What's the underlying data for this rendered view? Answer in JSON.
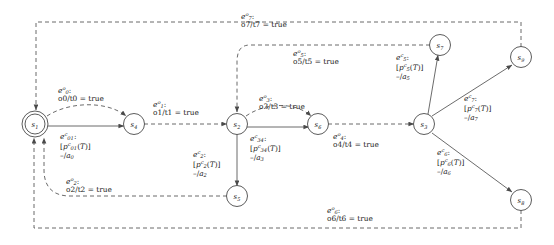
{
  "diagram": {
    "colors": {
      "stroke": "#5a5a5a",
      "text": "#1b1b1b",
      "background": "#ffffff"
    },
    "states": [
      {
        "id": "s1",
        "name": "s",
        "index": "1",
        "x": 35,
        "y": 124,
        "accepting": true
      },
      {
        "id": "s4",
        "name": "s",
        "index": "4",
        "x": 134,
        "y": 124,
        "accepting": false
      },
      {
        "id": "s2",
        "name": "s",
        "index": "2",
        "x": 237,
        "y": 124,
        "accepting": false
      },
      {
        "id": "s6",
        "name": "s",
        "index": "6",
        "x": 318,
        "y": 124,
        "accepting": false
      },
      {
        "id": "s3",
        "name": "s",
        "index": "3",
        "x": 424,
        "y": 124,
        "accepting": false
      },
      {
        "id": "s7",
        "name": "s",
        "index": "7",
        "x": 440,
        "y": 45,
        "accepting": false
      },
      {
        "id": "s9",
        "name": "s",
        "index": "9",
        "x": 521,
        "y": 57,
        "accepting": false
      },
      {
        "id": "s8",
        "name": "s",
        "index": "8",
        "x": 521,
        "y": 200,
        "accepting": false
      },
      {
        "id": "s5",
        "name": "s",
        "index": "5",
        "x": 237,
        "y": 196,
        "accepting": false
      }
    ],
    "edge_labels": [
      {
        "id": "e7o",
        "event": "e",
        "sup": "o",
        "sub": "7",
        "line2": "o7/t7 = true",
        "x": 245,
        "y": 14,
        "kind": "observable"
      },
      {
        "id": "e0o",
        "event": "e",
        "sup": "o",
        "sub": "0",
        "line2": "o0/t0 = true",
        "x": 62,
        "y": 88,
        "kind": "observable"
      },
      {
        "id": "e1o",
        "event": "e",
        "sup": "o",
        "sub": "1",
        "line2": "o1/t1 = true",
        "x": 157,
        "y": 102,
        "kind": "observable"
      },
      {
        "id": "e3o",
        "event": "e",
        "sup": "o",
        "sub": "3",
        "line2": "o3/t3 = true",
        "x": 262,
        "y": 96,
        "kind": "observable"
      },
      {
        "id": "e5o",
        "event": "e",
        "sup": "o",
        "sub": "5",
        "line2": "o5/t5 = true",
        "x": 296,
        "y": 51,
        "kind": "observable"
      },
      {
        "id": "e4o",
        "event": "e",
        "sup": "o",
        "sub": "4",
        "line2": "o4/t4 = true",
        "x": 337,
        "y": 133,
        "kind": "observable"
      },
      {
        "id": "e2o",
        "event": "e",
        "sup": "o",
        "sub": "2",
        "line2": "o2/t2 = true",
        "x": 70,
        "y": 181,
        "kind": "observable"
      },
      {
        "id": "e6o",
        "event": "e",
        "sup": "o",
        "sub": "6",
        "line2": "o6/t6 = true",
        "x": 330,
        "y": 208,
        "kind": "observable"
      }
    ],
    "ctrl_labels": [
      {
        "id": "e01c",
        "event": "e",
        "sup": "c",
        "sub": "01",
        "guard_p": "p",
        "guard_sup": "c",
        "guard_sub": "01",
        "guard_arg": "(T)",
        "action": "-/a",
        "action_sub": "0",
        "x": 63,
        "y": 134
      },
      {
        "id": "e2c",
        "event": "e",
        "sup": "c",
        "sub": "2",
        "guard_p": "p",
        "guard_sup": "c",
        "guard_sub": "2",
        "guard_arg": "(T)",
        "action": "-/a",
        "action_sub": "2",
        "x": 197,
        "y": 152
      },
      {
        "id": "e34c",
        "event": "e",
        "sup": "c",
        "sub": "34",
        "guard_p": "p",
        "guard_sup": "c",
        "guard_sub": "34",
        "guard_arg": "(T)",
        "action": "-/a",
        "action_sub": "3",
        "x": 253,
        "y": 136
      },
      {
        "id": "e5c",
        "event": "e",
        "sup": "c",
        "sub": "5",
        "guard_p": "p",
        "guard_sup": "c",
        "guard_sub": "5",
        "guard_arg": "(T)",
        "action": "-/a",
        "action_sub": "5",
        "x": 400,
        "y": 55
      },
      {
        "id": "e7c",
        "event": "e",
        "sup": "c",
        "sub": "7",
        "guard_p": "p",
        "guard_sup": "c",
        "guard_sub": "7",
        "guard_arg": "(T)",
        "action": "-/a",
        "action_sub": "7",
        "x": 468,
        "y": 96
      },
      {
        "id": "e6c",
        "event": "e",
        "sup": "c",
        "sub": "6",
        "guard_p": "p",
        "guard_sup": "c",
        "guard_sub": "6",
        "guard_arg": "(T)",
        "action": "-/a",
        "action_sub": "6",
        "x": 441,
        "y": 150
      }
    ],
    "transitions": [
      {
        "id": "t-s1-s4-obs",
        "from": "s1",
        "to": "s4",
        "style": "dashed",
        "label": "e0o"
      },
      {
        "id": "t-s1-s4-ctrl",
        "from": "s1",
        "to": "s4",
        "style": "solid",
        "label": "e01c"
      },
      {
        "id": "t-s4-s2-obs",
        "from": "s4",
        "to": "s2",
        "style": "dashed",
        "label": "e1o"
      },
      {
        "id": "t-s2-s6-obs",
        "from": "s2",
        "to": "s6",
        "style": "dashed",
        "label": "e3o"
      },
      {
        "id": "t-s2-s6-ctrl",
        "from": "s2",
        "to": "s6",
        "style": "solid",
        "label": "e34c"
      },
      {
        "id": "t-s2-s5-ctrl",
        "from": "s2",
        "to": "s5",
        "style": "solid",
        "label": "e2c"
      },
      {
        "id": "t-s6-s3-obs",
        "from": "s6",
        "to": "s3",
        "style": "dashed",
        "label": "e4o"
      },
      {
        "id": "t-s3-s7-ctrl",
        "from": "s3",
        "to": "s7",
        "style": "solid",
        "label": "e5c"
      },
      {
        "id": "t-s3-s9-ctrl",
        "from": "s3",
        "to": "s9",
        "style": "solid",
        "label": "e7c"
      },
      {
        "id": "t-s3-s8-ctrl",
        "from": "s3",
        "to": "s8",
        "style": "solid",
        "label": "e6c"
      },
      {
        "id": "t-s7-s2-obs",
        "from": "s7",
        "to": "s2",
        "style": "dashed",
        "label": "e5o"
      },
      {
        "id": "t-s9-s1-obs",
        "from": "s9",
        "to": "s1",
        "style": "dashed",
        "label": "e7o"
      },
      {
        "id": "t-s5-s1-obs",
        "from": "s5",
        "to": "s1",
        "style": "dashed",
        "label": "e2o"
      },
      {
        "id": "t-s8-s1-obs",
        "from": "s8",
        "to": "s1",
        "style": "dashed",
        "label": "e6o"
      }
    ]
  }
}
